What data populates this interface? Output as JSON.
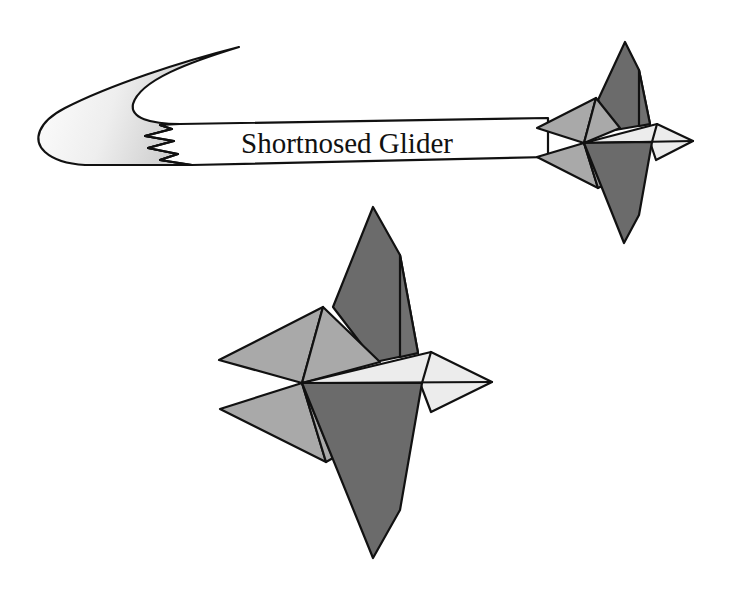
{
  "banner": {
    "title": "Shortnosed Glider"
  },
  "colors": {
    "background": "#ffffff",
    "outline": "#111111",
    "dark_face": "#6b6b6b",
    "medium_face": "#a9a9a9",
    "light_face": "#ececec",
    "banner_fill": "#ffffff",
    "swoosh_gradient_dark": "#c8c8c8",
    "swoosh_gradient_light": "#ffffff"
  },
  "figures": [
    {
      "name": "small-glider",
      "position": "top-right",
      "description": "Glider attached to the banner"
    },
    {
      "name": "large-glider",
      "position": "center",
      "description": "Enlarged view of the shortnosed paper glider"
    }
  ]
}
